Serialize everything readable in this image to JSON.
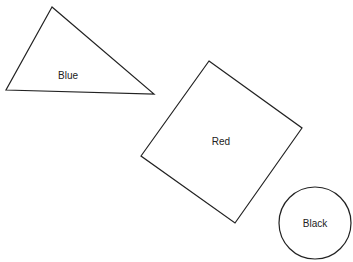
{
  "diagram": {
    "shapes": [
      {
        "type": "triangle",
        "label": "Blue",
        "points": "52,7 6,90 154,94",
        "label_x": 68,
        "label_y": 79
      },
      {
        "type": "square",
        "label": "Red",
        "points": "209,61 302,128 235,223 141,156",
        "label_x": 221,
        "label_y": 145
      },
      {
        "type": "circle",
        "label": "Black",
        "cx": 315,
        "cy": 223,
        "r": 36,
        "label_x": 315,
        "label_y": 227
      }
    ],
    "stroke_color": "#222222",
    "background": "#ffffff"
  }
}
